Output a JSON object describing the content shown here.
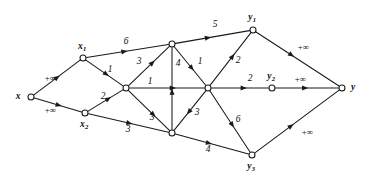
{
  "figure": {
    "kind": "directed-flow-network-diagram",
    "background_color": "#ffffff",
    "ink_color": "#1a1a1a",
    "width": 368,
    "height": 187
  },
  "nodes": [
    {
      "id": "x",
      "label": "x",
      "sub": "",
      "cx": 31,
      "cy": 97,
      "r": 3.0,
      "label_x": 18,
      "label_y": 97
    },
    {
      "id": "x1",
      "label": "x",
      "sub": "1",
      "cx": 83,
      "cy": 58,
      "r": 3.0,
      "label_x": 82,
      "label_y": 47
    },
    {
      "id": "x2",
      "label": "x",
      "sub": "2",
      "cx": 85,
      "cy": 113,
      "r": 3.0,
      "label_x": 84,
      "label_y": 125
    },
    {
      "id": "a",
      "label": "",
      "sub": "",
      "cx": 126,
      "cy": 88,
      "r": 3.0,
      "label_x": 0,
      "label_y": 0
    },
    {
      "id": "b",
      "label": "",
      "sub": "",
      "cx": 172,
      "cy": 44,
      "r": 3.0,
      "label_x": 0,
      "label_y": 0
    },
    {
      "id": "c",
      "label": "",
      "sub": "",
      "cx": 208,
      "cy": 88,
      "r": 3.0,
      "label_x": 0,
      "label_y": 0
    },
    {
      "id": "d",
      "label": "",
      "sub": "",
      "cx": 172,
      "cy": 133,
      "r": 3.0,
      "label_x": 0,
      "label_y": 0
    },
    {
      "id": "y1",
      "label": "y",
      "sub": "1",
      "cx": 253,
      "cy": 30,
      "r": 3.0,
      "label_x": 252,
      "label_y": 18
    },
    {
      "id": "y2",
      "label": "y",
      "sub": "2",
      "cx": 272,
      "cy": 88,
      "r": 3.0,
      "label_x": 271,
      "label_y": 77
    },
    {
      "id": "y3",
      "label": "y",
      "sub": "3",
      "cx": 252,
      "cy": 155,
      "r": 3.0,
      "label_x": 251,
      "label_y": 167
    },
    {
      "id": "y",
      "label": "y",
      "sub": "",
      "cx": 342,
      "cy": 88,
      "r": 3.0,
      "label_x": 353,
      "label_y": 88
    }
  ],
  "edges": [
    {
      "from": "x",
      "to": "x1",
      "capacity": "+∞",
      "label_x": 50,
      "label_y": 78,
      "label_class": "cap",
      "arrow_t": 0.56
    },
    {
      "from": "x",
      "to": "x2",
      "capacity": "+∞",
      "label_x": 50,
      "label_y": 110,
      "label_class": "cap",
      "arrow_t": 0.58
    },
    {
      "from": "x1",
      "to": "b",
      "capacity": "6",
      "label_x": 126,
      "label_y": 42,
      "label_class": "num",
      "arrow_t": 0.5
    },
    {
      "from": "x1",
      "to": "a",
      "capacity": "1",
      "label_x": 110,
      "label_y": 70,
      "label_class": "num",
      "arrow_t": 0.62
    },
    {
      "from": "x2",
      "to": "a",
      "capacity": "2",
      "label_x": 103,
      "label_y": 97,
      "label_class": "num",
      "arrow_t": 0.66
    },
    {
      "from": "x2",
      "to": "d",
      "capacity": "3",
      "label_x": 128,
      "label_y": 130,
      "label_class": "num",
      "arrow_t": 0.55
    },
    {
      "from": "a",
      "to": "b",
      "capacity": "3",
      "label_x": 139,
      "label_y": 62,
      "label_class": "num",
      "arrow_t": 0.64
    },
    {
      "from": "a",
      "to": "c",
      "capacity": "1",
      "label_x": 150,
      "label_y": 82,
      "label_class": "num",
      "arrow_t": 0.62
    },
    {
      "from": "a",
      "to": "d",
      "capacity": "3",
      "label_x": 152,
      "label_y": 118,
      "label_class": "num",
      "arrow_t": 0.66
    },
    {
      "from": "d",
      "to": "b",
      "capacity": "4",
      "label_x": 178,
      "label_y": 64,
      "label_class": "num",
      "arrow_t": 0.5
    },
    {
      "from": "b",
      "to": "c",
      "capacity": "1",
      "label_x": 200,
      "label_y": 62,
      "label_class": "num",
      "arrow_t": 0.62
    },
    {
      "from": "c",
      "to": "d",
      "capacity": "3",
      "label_x": 197,
      "label_y": 113,
      "label_class": "num",
      "arrow_t": 0.6
    },
    {
      "from": "b",
      "to": "y1",
      "capacity": "5",
      "label_x": 215,
      "label_y": 25,
      "label_class": "num",
      "arrow_t": 0.48
    },
    {
      "from": "c",
      "to": "y1",
      "capacity": "2",
      "label_x": 238,
      "label_y": 61,
      "label_class": "num",
      "arrow_t": 0.6
    },
    {
      "from": "c",
      "to": "y2",
      "capacity": "2",
      "label_x": 250,
      "label_y": 79,
      "label_class": "num",
      "arrow_t": 0.62
    },
    {
      "from": "c",
      "to": "y3",
      "capacity": "6",
      "label_x": 238,
      "label_y": 120,
      "label_class": "num",
      "arrow_t": 0.6
    },
    {
      "from": "d",
      "to": "y3",
      "capacity": "4",
      "label_x": 208,
      "label_y": 150,
      "label_class": "num",
      "arrow_t": 0.5
    },
    {
      "from": "y1",
      "to": "y",
      "capacity": "+∞",
      "label_x": 303,
      "label_y": 47,
      "label_class": "cap",
      "arrow_t": 0.46
    },
    {
      "from": "y2",
      "to": "y",
      "capacity": "+∞",
      "label_x": 300,
      "label_y": 79,
      "label_class": "cap",
      "arrow_t": 0.52
    },
    {
      "from": "y3",
      "to": "y",
      "capacity": "+∞",
      "label_x": 307,
      "label_y": 132,
      "label_class": "cap",
      "arrow_t": 0.46
    }
  ]
}
